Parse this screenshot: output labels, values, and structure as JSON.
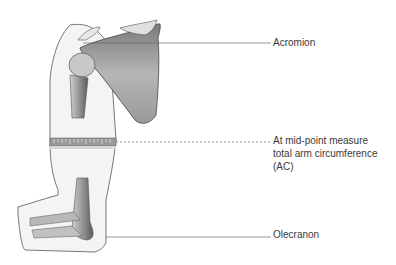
{
  "diagram": {
    "labels": {
      "acromion": "Acromion",
      "ac_line1": "At mid-point measure",
      "ac_line2": "total arm circumference",
      "ac_line3": "(AC)",
      "olecranon": "Olecranon"
    },
    "colors": {
      "outline": "#555555",
      "bone_shade": "#8a8a8a",
      "leader_line": "#6a6a6a",
      "tape": "#7a7a7a"
    }
  }
}
